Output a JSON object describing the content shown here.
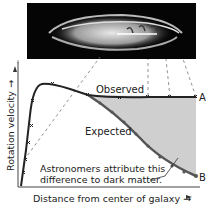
{
  "figure": {
    "galaxy_image_label": "Spiral galaxy (edge view)",
    "labels": {
      "observed": "Observed",
      "expected": "Expected",
      "curve_a": "A",
      "curve_b": "B",
      "annotation_line1": "Astronomers attribute this",
      "annotation_line2": "difference to dark matter.",
      "xlabel": "Distance from center of galaxy →",
      "ylabel": "Rotation velocity →"
    },
    "colors": {
      "observed_curve": "#222222",
      "expected_curve": "#555555",
      "shaded_region": "#cfcfcf",
      "galaxy_bg": "#050505"
    }
  }
}
